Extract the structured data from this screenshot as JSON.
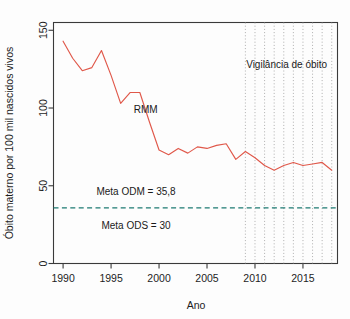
{
  "chart_data": {
    "type": "line",
    "title": "",
    "xlabel": "Ano",
    "ylabel": "Óbito materno por 100 mil nascidos vivos",
    "xlim": [
      1989,
      2018.6
    ],
    "ylim": [
      0,
      155
    ],
    "xticks": [
      1990,
      1995,
      2000,
      2005,
      2010,
      2015
    ],
    "xtick_labels": [
      "1990",
      "1995",
      "2000",
      "2005",
      "2010",
      "2015"
    ],
    "yticks": [
      0,
      50,
      100,
      150
    ],
    "ytick_labels": [
      "0",
      "50",
      "100",
      "150"
    ],
    "grid": "vertical dotted lines from 2009 to 2018 only",
    "legend": "none (inline labels)",
    "x": [
      1990,
      1991,
      1992,
      1993,
      1994,
      1995,
      1996,
      1997,
      1998,
      1999,
      2000,
      2001,
      2002,
      2003,
      2004,
      2005,
      2006,
      2007,
      2008,
      2009,
      2010,
      2011,
      2012,
      2013,
      2014,
      2015,
      2016,
      2017,
      2018
    ],
    "series": [
      {
        "name": "RMM",
        "color": "#e0584a",
        "values": [
          143,
          132,
          124,
          126,
          137,
          121,
          103,
          110,
          110,
          91,
          73,
          70,
          74,
          71,
          75,
          74,
          76,
          77,
          67,
          72,
          68,
          63,
          60,
          63,
          65,
          63,
          64,
          65,
          60
        ]
      }
    ],
    "reference_lines": [
      {
        "name": "Meta ODM",
        "value": 35.8,
        "label": "Meta ODM = 35,8",
        "color": "#1c7a72",
        "style": "dashed"
      },
      {
        "name": "Meta ODS",
        "value": 30,
        "label": "Meta ODS = 30",
        "color": "#1a1a1a",
        "style": "text-only"
      }
    ],
    "vertical_gridline_years": [
      2009,
      2010,
      2011,
      2012,
      2013,
      2014,
      2015,
      2016,
      2017,
      2018
    ],
    "annotations": [
      {
        "name": "series-label-rmm",
        "text": "RMM",
        "x": 1998.6,
        "y": 97
      },
      {
        "name": "surveillance-label",
        "text": "Vigilância de óbito",
        "x": 2013.3,
        "y": 126
      },
      {
        "name": "odm-target-label",
        "text": "Meta ODM = 35,8",
        "x": 1997.6,
        "y": 44
      },
      {
        "name": "ods-target-label",
        "text": "Meta ODS = 30",
        "x": 1997.6,
        "y": 22
      }
    ]
  },
  "axes": {
    "x_axis_title": "Ano",
    "y_axis_title": "Óbito materno por 100 mil nascidos vivos",
    "x_tick_1": "1990",
    "x_tick_2": "1995",
    "x_tick_3": "2000",
    "x_tick_4": "2005",
    "x_tick_5": "2010",
    "x_tick_6": "2015",
    "y_tick_1": "0",
    "y_tick_2": "50",
    "y_tick_3": "100",
    "y_tick_4": "150"
  },
  "labels": {
    "series_rmm": "RMM",
    "surveillance": "Vigilância de óbito",
    "target_odm": "Meta ODM = 35,8",
    "target_ods": "Meta ODS = 30"
  },
  "colors": {
    "series": "#e0584a",
    "target": "#1c7a72",
    "axis": "#3a3a3a",
    "grid": "#9a9a9a",
    "background": "#fdfdfd"
  }
}
